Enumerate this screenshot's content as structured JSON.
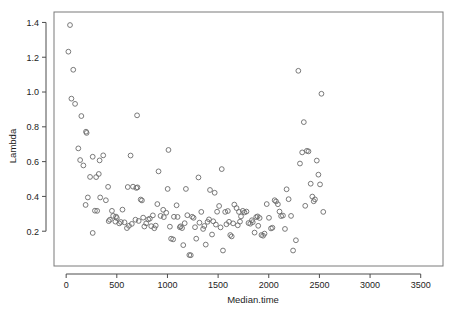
{
  "chart_data": {
    "type": "scatter",
    "title": "",
    "xlabel": "Median.time",
    "ylabel": "Lambda",
    "xlim": [
      -120,
      3720
    ],
    "ylim": [
      0.0,
      1.46
    ],
    "grid": false,
    "legend": null,
    "marker": {
      "shape": "open-circle",
      "radius": 2.4,
      "stroke": "#6b6b6b",
      "stroke_width": 0.9,
      "fill": "none"
    },
    "axis_color": "#4d4d4d",
    "frame_color": "#7a7a7a",
    "xticks": [
      0,
      500,
      1000,
      1500,
      2000,
      2500,
      3000,
      3500
    ],
    "xtick_labels": [
      "0",
      "500",
      "1000",
      "1500",
      "2000",
      "2500",
      "3000",
      "3500"
    ],
    "yticks": [
      0.2,
      0.4,
      0.6,
      0.8,
      1.0,
      1.2,
      1.4
    ],
    "ytick_labels": [
      "0.2",
      "0.4",
      "0.6",
      "0.8",
      "1.0",
      "1.2",
      "1.4"
    ],
    "n_points": 158,
    "points": [
      [
        38,
        1.385
      ],
      [
        22,
        1.232
      ],
      [
        70,
        1.128
      ],
      [
        52,
        0.962
      ],
      [
        88,
        0.932
      ],
      [
        150,
        0.862
      ],
      [
        196,
        0.772
      ],
      [
        202,
        0.765
      ],
      [
        120,
        0.676
      ],
      [
        138,
        0.609
      ],
      [
        170,
        0.578
      ],
      [
        262,
        0.628
      ],
      [
        330,
        0.607
      ],
      [
        366,
        0.636
      ],
      [
        700,
        0.866
      ],
      [
        236,
        0.512
      ],
      [
        296,
        0.511
      ],
      [
        322,
        0.529
      ],
      [
        214,
        0.394
      ],
      [
        192,
        0.351
      ],
      [
        284,
        0.318
      ],
      [
        306,
        0.317
      ],
      [
        336,
        0.394
      ],
      [
        414,
        0.455
      ],
      [
        392,
        0.378
      ],
      [
        262,
        0.19
      ],
      [
        452,
        0.317
      ],
      [
        464,
        0.288
      ],
      [
        492,
        0.284
      ],
      [
        500,
        0.276
      ],
      [
        486,
        0.255
      ],
      [
        524,
        0.245
      ],
      [
        556,
        0.324
      ],
      [
        608,
        0.454
      ],
      [
        660,
        0.456
      ],
      [
        636,
        0.635
      ],
      [
        600,
        0.218
      ],
      [
        692,
        0.449
      ],
      [
        704,
        0.452
      ],
      [
        748,
        0.377
      ],
      [
        736,
        0.382
      ],
      [
        772,
        0.227
      ],
      [
        790,
        0.245
      ],
      [
        810,
        0.268
      ],
      [
        826,
        0.272
      ],
      [
        856,
        0.291
      ],
      [
        870,
        0.217
      ],
      [
        900,
        0.356
      ],
      [
        912,
        0.544
      ],
      [
        958,
        0.323
      ],
      [
        964,
        0.281
      ],
      [
        1010,
        0.667
      ],
      [
        1002,
        0.443
      ],
      [
        1036,
        0.157
      ],
      [
        1056,
        0.153
      ],
      [
        1064,
        0.283
      ],
      [
        1090,
        0.349
      ],
      [
        1122,
        0.223
      ],
      [
        1130,
        0.228
      ],
      [
        1156,
        0.12
      ],
      [
        1182,
        0.443
      ],
      [
        1196,
        0.292
      ],
      [
        1216,
        0.063
      ],
      [
        1230,
        0.062
      ],
      [
        1258,
        0.277
      ],
      [
        1284,
        0.157
      ],
      [
        1306,
        0.509
      ],
      [
        1334,
        0.311
      ],
      [
        1352,
        0.213
      ],
      [
        1378,
        0.123
      ],
      [
        1396,
        0.254
      ],
      [
        1420,
        0.437
      ],
      [
        1440,
        0.181
      ],
      [
        1466,
        0.421
      ],
      [
        1490,
        0.312
      ],
      [
        1510,
        0.345
      ],
      [
        1536,
        0.557
      ],
      [
        1548,
        0.089
      ],
      [
        1570,
        0.311
      ],
      [
        1596,
        0.316
      ],
      [
        1620,
        0.178
      ],
      [
        1634,
        0.17
      ],
      [
        1660,
        0.353
      ],
      [
        1682,
        0.333
      ],
      [
        1706,
        0.311
      ],
      [
        1726,
        0.285
      ],
      [
        1744,
        0.317
      ],
      [
        1760,
        0.308
      ],
      [
        1780,
        0.313
      ],
      [
        1800,
        0.247
      ],
      [
        1818,
        0.243
      ],
      [
        1842,
        0.252
      ],
      [
        1860,
        0.192
      ],
      [
        1876,
        0.281
      ],
      [
        1890,
        0.285
      ],
      [
        1910,
        0.276
      ],
      [
        1928,
        0.178
      ],
      [
        1944,
        0.174
      ],
      [
        1958,
        0.186
      ],
      [
        1980,
        0.356
      ],
      [
        2002,
        0.277
      ],
      [
        2022,
        0.216
      ],
      [
        2036,
        0.22
      ],
      [
        2058,
        0.378
      ],
      [
        2072,
        0.371
      ],
      [
        2090,
        0.355
      ],
      [
        2106,
        0.313
      ],
      [
        2122,
        0.287
      ],
      [
        2140,
        0.29
      ],
      [
        2160,
        0.213
      ],
      [
        2176,
        0.441
      ],
      [
        2196,
        0.384
      ],
      [
        2220,
        0.288
      ],
      [
        2240,
        0.089
      ],
      [
        2268,
        0.148
      ],
      [
        2292,
        1.122
      ],
      [
        2308,
        0.589
      ],
      [
        2330,
        0.653
      ],
      [
        2346,
        0.827
      ],
      [
        2360,
        0.346
      ],
      [
        2376,
        0.662
      ],
      [
        2392,
        0.659
      ],
      [
        2414,
        0.473
      ],
      [
        2430,
        0.399
      ],
      [
        2444,
        0.372
      ],
      [
        2456,
        0.383
      ],
      [
        2474,
        0.606
      ],
      [
        2490,
        0.525
      ],
      [
        2506,
        0.469
      ],
      [
        2520,
        0.99
      ],
      [
        2538,
        0.311
      ],
      [
        420,
        0.258
      ],
      [
        432,
        0.266
      ],
      [
        540,
        0.253
      ],
      [
        576,
        0.251
      ],
      [
        620,
        0.231
      ],
      [
        648,
        0.242
      ],
      [
        684,
        0.266
      ],
      [
        716,
        0.259
      ],
      [
        760,
        0.278
      ],
      [
        840,
        0.229
      ],
      [
        884,
        0.232
      ],
      [
        932,
        0.288
      ],
      [
        988,
        0.306
      ],
      [
        1024,
        0.226
      ],
      [
        1100,
        0.282
      ],
      [
        1144,
        0.218
      ],
      [
        1170,
        0.246
      ],
      [
        1244,
        0.283
      ],
      [
        1272,
        0.223
      ],
      [
        1316,
        0.249
      ],
      [
        1364,
        0.23
      ],
      [
        1410,
        0.268
      ],
      [
        1452,
        0.257
      ],
      [
        1478,
        0.238
      ],
      [
        1524,
        0.222
      ],
      [
        1582,
        0.24
      ],
      [
        1608,
        0.254
      ],
      [
        1648,
        0.245
      ],
      [
        1694,
        0.234
      ],
      [
        1716,
        0.255
      ],
      [
        1834,
        0.263
      ],
      [
        1896,
        0.231
      ]
    ]
  }
}
